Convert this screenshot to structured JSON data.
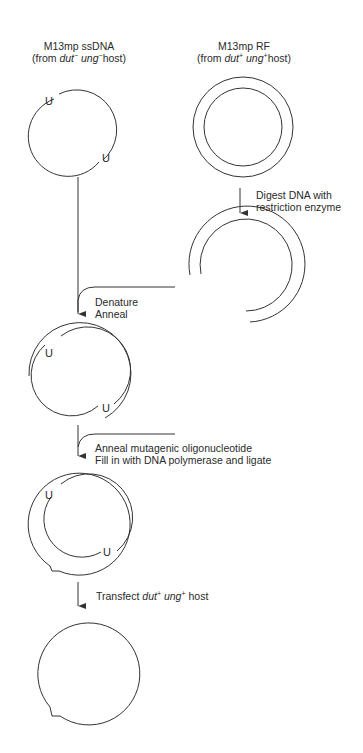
{
  "ssdna": {
    "title": "M13mp ssDNA",
    "source_prefix": "(from ",
    "gene1": "dut",
    "gene1_sup": "−",
    "gene2": "ung",
    "gene2_sup": "−",
    "source_suffix": "host)",
    "marker": "U"
  },
  "rf": {
    "title": "M13mp RF",
    "source_prefix": "(from ",
    "gene1": "dut",
    "gene1_sup": "+",
    "gene2": "ung",
    "gene2_sup": "+",
    "source_suffix": "host)"
  },
  "steps": {
    "digest_line1": "Digest DNA with",
    "digest_line2": "restriction enzyme",
    "denature": "Denature",
    "anneal": "Anneal",
    "anneal_oligo": "Anneal mutagenic oligonucleotide",
    "fill_in": "Fill in with DNA polymerase and ligate",
    "transfect_prefix": "Transfect ",
    "transfect_gene1": "dut",
    "transfect_gene1_sup": "+",
    "transfect_gene2": "ung",
    "transfect_gene2_sup": "+",
    "transfect_suffix": " host"
  },
  "colors": {
    "line": "#333333",
    "background": "#ffffff"
  }
}
